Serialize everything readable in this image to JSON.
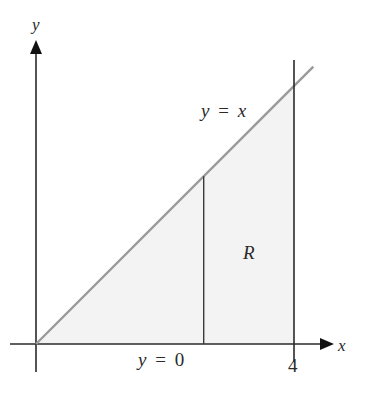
{
  "diagram": {
    "type": "region-bounded-by-curves",
    "axes": {
      "x_label": "x",
      "y_label": "y"
    },
    "curves": [
      {
        "label_var": "y",
        "label_eq": "=",
        "label_rhs": "x",
        "expression": "y = x"
      },
      {
        "label_var": "y",
        "label_eq": "=",
        "label_rhs": "0",
        "expression": "y = 0"
      }
    ],
    "bounds": {
      "x_min": 0,
      "x_max": 4,
      "x_tick_label": "4"
    },
    "region_label": "R",
    "strip_x": 2.6,
    "colors": {
      "axis": "#2a2a2a",
      "curve": "#9a9a9a",
      "region_fill": "#f3f3f3",
      "strip": "#3a3a3a"
    }
  }
}
